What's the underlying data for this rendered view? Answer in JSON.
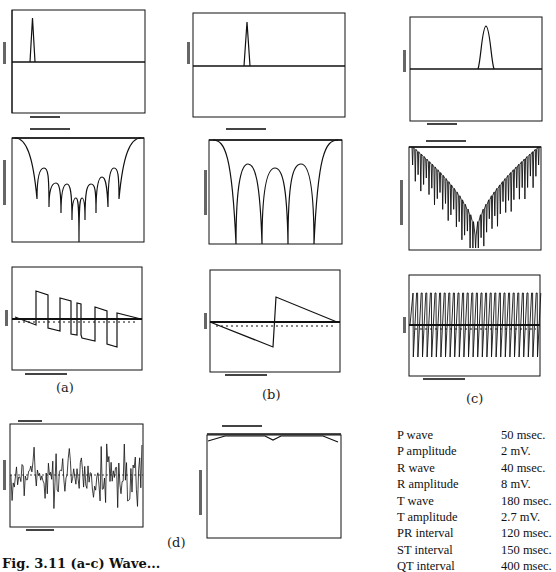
{
  "figure": {
    "caption_fragment": "Fig. 3.11 (a-c) Wave...",
    "panel_labels": {
      "a": "(a)",
      "b": "(b)",
      "c": "(c)",
      "d": "(d)"
    },
    "axis_text_note": "tick labels illegible at source resolution"
  },
  "parameters": {
    "rows": [
      {
        "name": "P wave",
        "value": "50 msec."
      },
      {
        "name": "P amplitude",
        "value": "2 mV."
      },
      {
        "name": "R wave",
        "value": "40 msec."
      },
      {
        "name": "R amplitude",
        "value": "8 mV."
      },
      {
        "name": "T wave",
        "value": "180 msec."
      },
      {
        "name": "T amplitude",
        "value": "2.7 mV."
      },
      {
        "name": "PR interval",
        "value": "120 msec."
      },
      {
        "name": "ST interval",
        "value": "150 msec."
      },
      {
        "name": "QT interval",
        "value": "400 msec."
      }
    ]
  },
  "chart_data": [
    {
      "id": "a-time",
      "type": "line",
      "title": "",
      "xlabel": "TIME (sec)",
      "ylabel": "AMPLITUDE",
      "description": "Single narrow triangular pulse (P wave) near x=0.12 of range",
      "pulse_center": 0.14,
      "pulse_width": 0.05,
      "pulse_height": 0.82
    },
    {
      "id": "b-time",
      "type": "line",
      "xlabel": "TIME (sec)",
      "ylabel": "AMPLITUDE",
      "description": "Single narrow triangular pulse (R wave) near x=0.28 of range",
      "pulse_center": 0.28,
      "pulse_width": 0.04,
      "pulse_height": 0.82
    },
    {
      "id": "c-time",
      "type": "line",
      "xlabel": "TIME (sec)",
      "ylabel": "AMPLITUDE",
      "description": "Smooth half-sine pulse (T wave) near x=0.58 of range",
      "pulse_center": 0.58,
      "pulse_width": 0.12,
      "pulse_height": 0.78
    },
    {
      "id": "a-mag",
      "type": "line",
      "xlabel": "FREQUENCY (Hz)",
      "ylabel": "MAGNITUDE (dB)",
      "description": "Sinc-like magnitude spectrum in dB with ~8 lobes, symmetric, deep null at center"
    },
    {
      "id": "b-mag",
      "type": "line",
      "xlabel": "FREQUENCY (Hz)",
      "ylabel": "MAGNITUDE (dB)",
      "description": "Magnitude spectrum with 4 nulls and 3 inner lobes, symmetric"
    },
    {
      "id": "c-mag",
      "type": "line",
      "xlabel": "FREQUENCY (Hz)",
      "ylabel": "MAGNITUDE (dB)",
      "description": "V-shaped envelope with dense comb nulls"
    },
    {
      "id": "a-phase",
      "type": "line",
      "xlabel": "FREQUENCY (Hz)",
      "ylabel": "PHASE",
      "description": "Piecewise-linear phase with ~6 jumps"
    },
    {
      "id": "b-phase",
      "type": "line",
      "xlabel": "FREQUENCY (Hz)",
      "ylabel": "PHASE",
      "description": "Linear phase descending to -0.5, jump to +0.55 at midpoint, descending to 0"
    },
    {
      "id": "c-phase",
      "type": "line",
      "xlabel": "FREQUENCY (Hz)",
      "ylabel": "PHASE",
      "description": "Rapidly oscillating phase (~28 cycles) between about +0.55 and -0.6"
    },
    {
      "id": "d-noise",
      "type": "line",
      "title": "AMPLITUDE (mV)",
      "xlabel": "TIME (sec)",
      "description": "Random noise signal around zero"
    },
    {
      "id": "d-mag",
      "type": "line",
      "xlabel": "FREQUENCY (Hz)",
      "ylabel": "MAGNITUDE (dB)",
      "description": "Nearly flat magnitude near top with slight dip at center and ends"
    }
  ]
}
